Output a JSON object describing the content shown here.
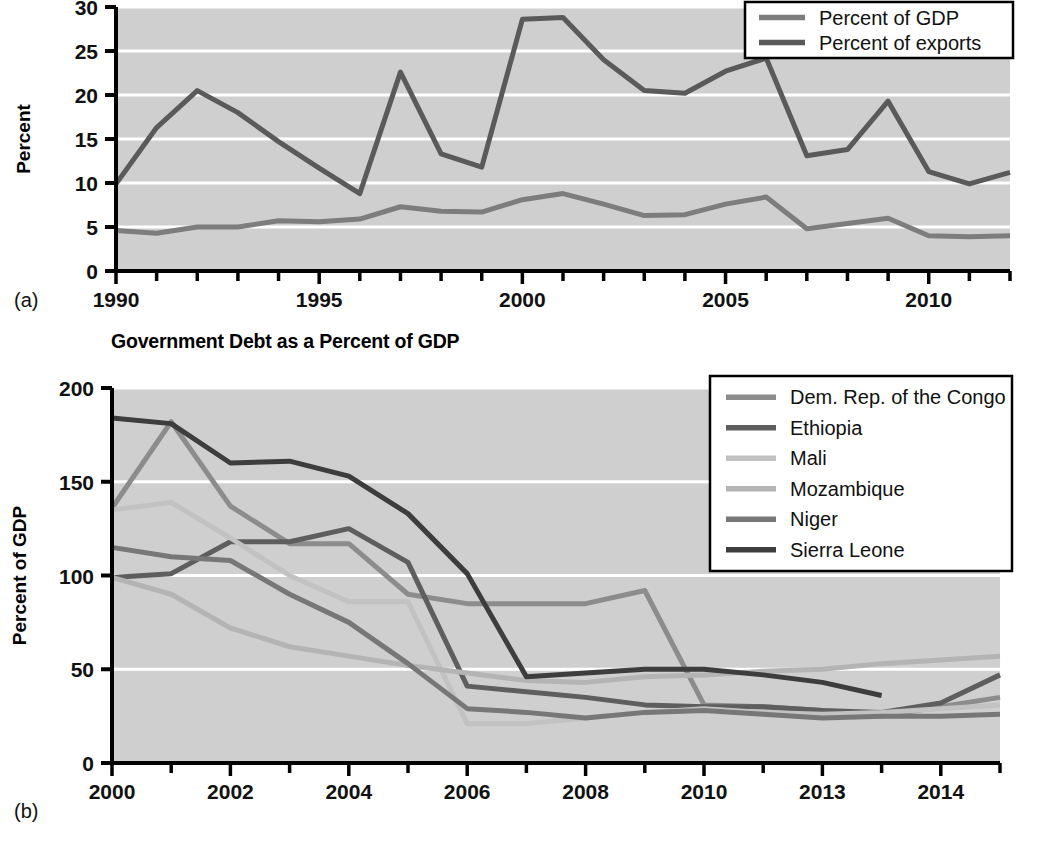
{
  "figure": {
    "panel_a_label": "(a)",
    "panel_b_label": "(b)"
  },
  "colors": {
    "plot_background": "#cfcfcf",
    "gridline": "#ffffff",
    "axis": "#000000",
    "legend_background": "#ffffff",
    "legend_border": "#000000",
    "percent_of_gdp": "#7d7d7d",
    "percent_of_exports": "#5a5a5a",
    "congo": "#8c8c8c",
    "ethiopia": "#5e5e5e",
    "mali": "#c2c2c2",
    "mozambique": "#b4b4b4",
    "niger": "#777777",
    "sierra_leone": "#3d3d3d"
  },
  "chart_data": [
    {
      "id": "chart-a",
      "type": "line",
      "title": "",
      "xlabel": "",
      "ylabel": "Percent",
      "ylim": [
        0,
        30
      ],
      "yticks": [
        0,
        5,
        10,
        15,
        20,
        25,
        30
      ],
      "ytick_labels": [
        "0",
        "5",
        "10",
        "15",
        "20",
        "25",
        "30"
      ],
      "xlim": [
        1990,
        2012
      ],
      "xticks": [
        1990,
        1991,
        1992,
        1993,
        1994,
        1995,
        1996,
        1997,
        1998,
        1999,
        2000,
        2001,
        2002,
        2003,
        2004,
        2005,
        2006,
        2007,
        2008,
        2009,
        2010,
        2011,
        2012
      ],
      "xtick_labels": [
        "1990",
        "1995",
        "2000",
        "2005",
        "2010"
      ],
      "labeled_xticks": [
        1990,
        1995,
        2000,
        2005,
        2010
      ],
      "grid": true,
      "legend_position": "top-right",
      "x": [
        1990,
        1991,
        1992,
        1993,
        1994,
        1995,
        1996,
        1997,
        1998,
        1999,
        2000,
        2001,
        2002,
        2003,
        2004,
        2005,
        2006,
        2007,
        2008,
        2009,
        2010,
        2011,
        2012
      ],
      "series": [
        {
          "name": "Percent of GDP",
          "color_key": "percent_of_gdp",
          "values": [
            4.6,
            4.3,
            5.0,
            5.0,
            5.7,
            5.6,
            5.9,
            7.3,
            6.8,
            6.7,
            8.1,
            8.8,
            7.6,
            6.3,
            6.4,
            7.6,
            8.4,
            4.8,
            5.4,
            6.0,
            4.0,
            3.9,
            4.0
          ]
        },
        {
          "name": "Percent of exports",
          "color_key": "percent_of_exports",
          "values": [
            9.9,
            16.3,
            20.5,
            18.0,
            14.7,
            11.7,
            8.8,
            22.6,
            13.3,
            11.8,
            28.6,
            28.8,
            24.0,
            20.5,
            20.2,
            22.7,
            24.2,
            13.1,
            13.8,
            19.3,
            11.3,
            9.9,
            11.2
          ]
        }
      ]
    },
    {
      "id": "chart-b",
      "type": "line",
      "title": "Government Debt as a Percent of GDP",
      "xlabel": "",
      "ylabel": "Percent of GDP",
      "ylim": [
        0,
        200
      ],
      "yticks": [
        0,
        50,
        100,
        150,
        200
      ],
      "ytick_labels": [
        "0",
        "50",
        "100",
        "150",
        "200"
      ],
      "xlim": [
        2000,
        2015
      ],
      "xticks": [
        2000,
        2001,
        2002,
        2003,
        2004,
        2005,
        2006,
        2007,
        2008,
        2009,
        2010,
        2011,
        2012,
        2013,
        2014,
        2015
      ],
      "xtick_labels": [
        "2000",
        "2002",
        "2004",
        "2006",
        "2008",
        "2010",
        "2013",
        "2014"
      ],
      "labeled_xticks": [
        2000,
        2002,
        2004,
        2006,
        2008,
        2010,
        2012,
        2014
      ],
      "grid": true,
      "legend_position": "top-right",
      "x": [
        2000,
        2001,
        2002,
        2003,
        2004,
        2005,
        2006,
        2007,
        2008,
        2009,
        2010,
        2011,
        2012,
        2013,
        2014,
        2015
      ],
      "series": [
        {
          "name": "Dem. Rep. of the Congo",
          "color_key": "congo",
          "values": [
            136,
            182,
            137,
            117,
            117,
            90,
            85,
            85,
            85,
            92,
            31,
            30,
            28,
            25,
            30,
            35
          ]
        },
        {
          "name": "Ethiopia",
          "color_key": "ethiopia",
          "values": [
            99,
            101,
            118,
            118,
            125,
            107,
            41,
            38,
            35,
            31,
            30,
            30,
            28,
            27,
            32,
            47
          ]
        },
        {
          "name": "Mali",
          "color_key": "mali",
          "values": [
            135,
            139,
            120,
            100,
            86,
            86,
            21,
            21,
            24,
            27,
            29,
            27,
            26,
            27,
            29,
            31
          ]
        },
        {
          "name": "Mozambique",
          "color_key": "mozambique",
          "values": [
            99,
            90,
            72,
            62,
            57,
            52,
            48,
            44,
            43,
            46,
            47,
            49,
            50,
            53,
            55,
            57
          ]
        },
        {
          "name": "Niger",
          "color_key": "niger",
          "values": [
            115,
            110,
            108,
            90,
            75,
            53,
            29,
            27,
            24,
            27,
            28,
            26,
            24,
            25,
            25,
            26
          ]
        },
        {
          "name": "Sierra Leone",
          "color_key": "sierra_leone",
          "values": [
            184,
            181,
            160,
            161,
            153,
            133,
            101,
            46,
            48,
            50,
            50,
            47,
            43,
            36,
            null,
            null
          ]
        }
      ]
    }
  ]
}
